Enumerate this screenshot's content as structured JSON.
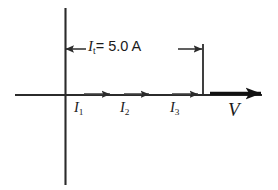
{
  "figure": {
    "type": "physics-diagram",
    "background_color": "#ffffff",
    "line_color": "#2b2b2b",
    "text_color": "#1a1a1a"
  },
  "dimension": {
    "symbol": "I",
    "subscript": "t",
    "equals_value": "= 5.0 A",
    "full_text": "I_t = 5.0 A"
  },
  "currents": [
    {
      "symbol": "I",
      "subscript": "1"
    },
    {
      "symbol": "I",
      "subscript": "2"
    },
    {
      "symbol": "I",
      "subscript": "3"
    }
  ],
  "velocity": {
    "symbol": "V"
  },
  "axes": {
    "vertical_axis_name": "vertical-axis",
    "horizontal_axis_name": "horizontal-axis"
  }
}
